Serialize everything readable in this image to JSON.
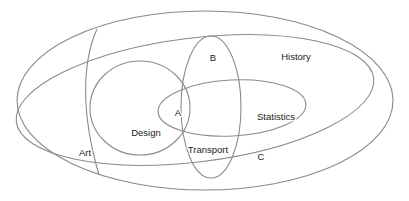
{
  "diagram": {
    "type": "venn-diagram",
    "title": "",
    "stroke_color": "#8a8a8a",
    "text_color": "#1b1b1b",
    "background_color": "#ffffff",
    "labels": {
      "a": "A",
      "b": "B",
      "c": "C",
      "art": "Art",
      "design": "Design",
      "transport": "Transport",
      "statistics": "Statistics",
      "history": "History"
    },
    "regions": [
      {
        "name": "universe-ellipse",
        "label": "C",
        "shape": "ellipse"
      },
      {
        "name": "history-ellipse",
        "label": "History",
        "shape": "ellipse"
      },
      {
        "name": "art-arc",
        "label": "Art",
        "shape": "arc"
      },
      {
        "name": "design-circle",
        "label": "Design",
        "shape": "circle"
      },
      {
        "name": "transport-ellipse",
        "label": "B",
        "shape": "ellipse"
      },
      {
        "name": "statistics-ellipse",
        "label": "Statistics",
        "shape": "ellipse"
      },
      {
        "name": "intersection-center",
        "label": "A",
        "shape": "intersection"
      }
    ]
  }
}
